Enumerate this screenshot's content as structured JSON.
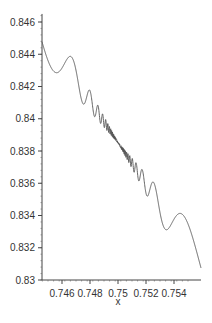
{
  "chart_data": {
    "type": "line",
    "title": "",
    "xlabel": "x",
    "ylabel": "",
    "xlim": [
      0.7445,
      0.7551
    ],
    "ylim": [
      0.83,
      0.8465
    ],
    "grid": false,
    "legend": null,
    "x_ticks": [
      0.746,
      0.748,
      0.75,
      0.752,
      0.754
    ],
    "x_tick_labels": [
      "0.746",
      "0.748",
      "0.75",
      "0.752",
      "0.754"
    ],
    "y_ticks": [
      0.83,
      0.832,
      0.834,
      0.836,
      0.838,
      0.84,
      0.842,
      0.844,
      0.846
    ],
    "y_tick_labels": [
      "0.83",
      "0.832",
      "0.834",
      "0.836",
      "0.838",
      "0.84",
      "0.842",
      "0.844",
      "0.846"
    ],
    "series": [
      {
        "name": "f(x)",
        "color": "#555555",
        "description": "Decreasing curve with oscillations whose amplitude shrinks and frequency grows toward x=0.75, then grows again",
        "x": [
          0.7445,
          0.7452,
          0.7457,
          0.7462,
          0.7467,
          0.7472,
          0.7475,
          0.7478,
          0.748,
          0.7482,
          0.7484,
          0.7486,
          0.7488,
          0.749,
          0.7495,
          0.75,
          0.7505,
          0.751,
          0.7512,
          0.7514,
          0.7516,
          0.7518,
          0.752,
          0.7522,
          0.7525,
          0.7528,
          0.7533,
          0.7538,
          0.7543,
          0.7548,
          0.7551
        ],
        "y": [
          0.8461,
          0.845,
          0.8457,
          0.8435,
          0.8442,
          0.8425,
          0.8431,
          0.8419,
          0.8424,
          0.8415,
          0.8419,
          0.8411,
          0.8414,
          0.8408,
          0.84,
          0.8392,
          0.8384,
          0.8376,
          0.8379,
          0.8372,
          0.8375,
          0.8367,
          0.837,
          0.836,
          0.8365,
          0.835,
          0.8358,
          0.8336,
          0.8344,
          0.8303,
          0.8305
        ]
      }
    ]
  }
}
